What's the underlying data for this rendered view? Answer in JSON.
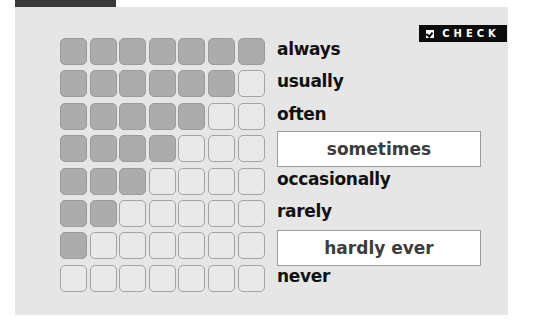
{
  "badge": {
    "icon": "checkbox-tick-icon",
    "label": "CHECK"
  },
  "colors": {
    "filled": "#acacac",
    "empty": "#e9e9e9",
    "panel": "#e6e6e6",
    "badge_bg": "#0c0c0c"
  },
  "scale": [
    {
      "label": "always",
      "filled": 7,
      "boxed": false
    },
    {
      "label": "usually",
      "filled": 6,
      "boxed": false
    },
    {
      "label": "often",
      "filled": 5,
      "boxed": false
    },
    {
      "label": "sometimes",
      "filled": 4,
      "boxed": true
    },
    {
      "label": "occasionally",
      "filled": 3,
      "boxed": false
    },
    {
      "label": "rarely",
      "filled": 2,
      "boxed": false
    },
    {
      "label": "hardly ever",
      "filled": 1,
      "boxed": true
    },
    {
      "label": "never",
      "filled": 0,
      "boxed": false
    }
  ],
  "columns": 7
}
